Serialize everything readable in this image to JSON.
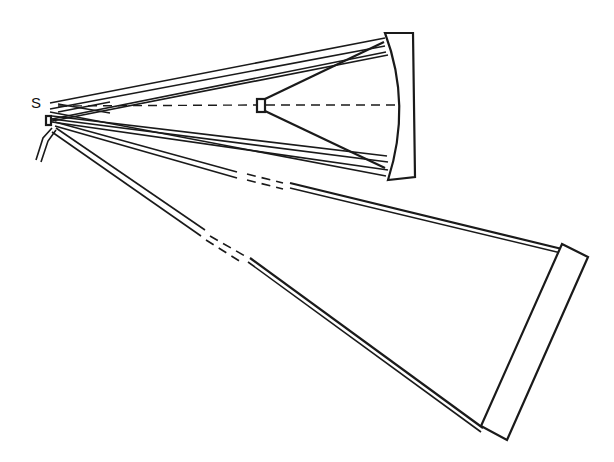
{
  "diagram": {
    "type": "optical-schematic",
    "labels": {
      "source": "S"
    },
    "elements": [
      {
        "id": "source",
        "label": "S",
        "kind": "point-source"
      },
      {
        "id": "source-aperture",
        "kind": "small-rectangle"
      },
      {
        "id": "slit-holder",
        "kind": "angled-double-line"
      },
      {
        "id": "secondary-element",
        "kind": "small-rectangle-on-axis"
      },
      {
        "id": "upper-mirror",
        "kind": "concave-mirror"
      },
      {
        "id": "lower-mirror",
        "kind": "flat-mirror-tilted"
      }
    ],
    "colors": {
      "line": "#1a1a1a",
      "background": "#ffffff"
    }
  }
}
